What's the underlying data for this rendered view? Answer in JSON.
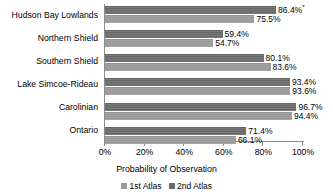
{
  "chart_data": {
    "type": "bar",
    "orientation": "horizontal",
    "title": "",
    "xlabel": "Probability of Observation",
    "ylabel": "",
    "xlim": [
      0,
      100
    ],
    "grid": false,
    "legend_position": "bottom",
    "categories": [
      "Hudson Bay Lowlands",
      "Northern Shield",
      "Southern Shield",
      "Lake Simcoe-Rideau",
      "Carolinian",
      "Ontario"
    ],
    "tick_labels": [
      "0%",
      "20%",
      "40%",
      "60%",
      "80%",
      "100%"
    ],
    "tick_values": [
      0,
      20,
      40,
      60,
      80,
      100
    ],
    "series": [
      {
        "name": "2nd Atlas",
        "color": "#6b6b6b",
        "values": [
          86.4,
          59.4,
          80.1,
          93.4,
          96.7,
          71.4
        ],
        "labels": [
          "86.4%",
          "59.4%",
          "80.1%",
          "93.4%",
          "96.7%",
          "71.4%"
        ],
        "annotations": [
          "*",
          "",
          "",
          "",
          "",
          ""
        ]
      },
      {
        "name": "1st Atlas",
        "color": "#9b9b9b",
        "values": [
          75.5,
          54.7,
          83.6,
          93.6,
          94.4,
          66.1
        ],
        "labels": [
          "75.5%",
          "54.7%",
          "83.6%",
          "93.6%",
          "94.4%",
          "66.1%"
        ],
        "annotations": [
          "",
          "",
          "",
          "",
          "",
          ""
        ]
      }
    ],
    "legend": [
      "1st Atlas",
      "2nd Atlas"
    ]
  },
  "axis": {
    "title": "Probability of Observation"
  },
  "legend": {
    "entries": [
      {
        "label": "1st Atlas",
        "swatch": "series-first"
      },
      {
        "label": "2nd Atlas",
        "swatch": "series-second"
      }
    ]
  }
}
